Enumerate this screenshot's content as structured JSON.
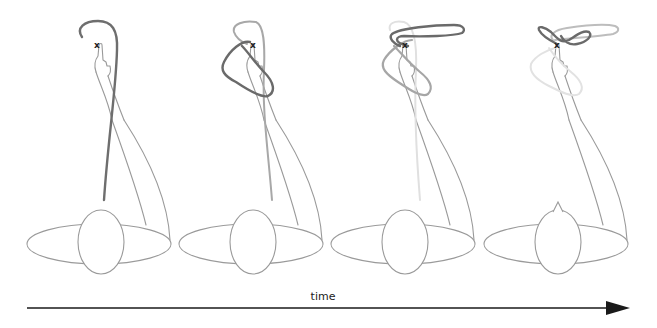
{
  "figure": {
    "target_marker": "x",
    "axis_label": "time",
    "panel_count": 4,
    "colors": {
      "body_outline": "#9a9a9a",
      "trajectory_current": "#6e6e6e",
      "trajectory_previous": "#a4a4a4",
      "trajectory_older": "#c9c9c9",
      "trajectory_oldest": "#e2e2e2",
      "arrow": "#1a1a1a"
    }
  },
  "panels": [
    {
      "index": 1,
      "offset_x": 0,
      "target_label": "x",
      "nose": "small"
    },
    {
      "index": 2,
      "offset_x": 152,
      "target_label": "x",
      "nose": "small"
    },
    {
      "index": 3,
      "offset_x": 304,
      "target_label": "x",
      "nose": "small"
    },
    {
      "index": 4,
      "offset_x": 457,
      "target_label": "x",
      "nose": "pointed"
    }
  ],
  "time_axis": {
    "label": "time",
    "x_start": 27,
    "x_end": 630,
    "y": 308
  }
}
